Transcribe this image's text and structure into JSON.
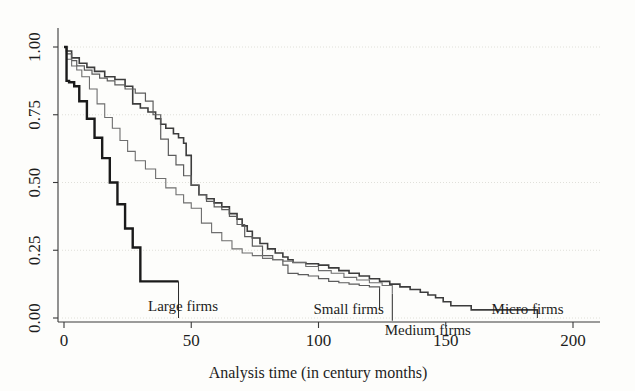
{
  "chart_data": {
    "type": "line",
    "subtype": "kaplan-meier-step",
    "title": "",
    "xlabel": "Analysis time (in century months)",
    "ylabel": "",
    "xlim": [
      -5,
      210
    ],
    "ylim": [
      0.0,
      1.0
    ],
    "xticks": [
      0,
      50,
      100,
      150,
      200
    ],
    "xtick_labels": [
      "0",
      "50",
      "100",
      "150",
      "200"
    ],
    "yticks": [
      0.0,
      0.25,
      0.5,
      0.75,
      1.0
    ],
    "ytick_labels": [
      "0.00",
      "0.25",
      "0.50",
      "0.75",
      "1.00"
    ],
    "grid": "horizontal-faint",
    "legend": "inline-annotations",
    "series": [
      {
        "name": "Micro firms",
        "label": "Micro firms",
        "color": "#3c3c3c",
        "stroke_width": 1.6,
        "x": [
          0,
          1,
          3,
          6,
          9,
          12,
          16,
          20,
          24,
          27,
          30,
          33,
          36,
          38,
          40,
          43,
          45,
          47,
          48,
          50,
          53,
          56,
          59,
          62,
          65,
          68,
          70,
          72,
          74,
          77,
          80,
          83,
          86,
          88,
          90,
          95,
          100,
          104,
          108,
          112,
          116,
          120,
          124,
          128,
          132,
          136,
          140,
          143,
          146,
          149,
          152,
          160,
          170,
          180,
          186
        ],
        "y": [
          1.0,
          0.985,
          0.96,
          0.94,
          0.925,
          0.91,
          0.89,
          0.88,
          0.855,
          0.79,
          0.775,
          0.76,
          0.735,
          0.715,
          0.7,
          0.68,
          0.665,
          0.645,
          0.6,
          0.49,
          0.455,
          0.44,
          0.425,
          0.41,
          0.385,
          0.365,
          0.34,
          0.32,
          0.295,
          0.275,
          0.255,
          0.24,
          0.225,
          0.215,
          0.205,
          0.2,
          0.195,
          0.185,
          0.175,
          0.165,
          0.155,
          0.145,
          0.135,
          0.125,
          0.115,
          0.105,
          0.095,
          0.085,
          0.075,
          0.06,
          0.045,
          0.03,
          0.03,
          0.03,
          0.015
        ]
      },
      {
        "name": "Small firms",
        "label": "Small firms",
        "color": "#5c5c5c",
        "stroke_width": 1.2,
        "x": [
          0,
          1,
          3,
          5,
          8,
          11,
          14,
          17,
          20,
          24,
          28,
          32,
          35,
          38,
          41,
          44,
          47,
          50,
          53,
          56,
          59,
          62,
          65,
          68,
          71,
          74,
          78,
          82,
          86,
          88,
          92,
          96,
          100,
          104,
          108,
          112,
          116,
          120,
          124
        ],
        "y": [
          1.0,
          0.975,
          0.95,
          0.93,
          0.915,
          0.9,
          0.885,
          0.875,
          0.86,
          0.845,
          0.83,
          0.8,
          0.75,
          0.66,
          0.6,
          0.565,
          0.525,
          0.49,
          0.455,
          0.43,
          0.41,
          0.4,
          0.375,
          0.345,
          0.3,
          0.265,
          0.23,
          0.215,
          0.195,
          0.165,
          0.16,
          0.155,
          0.145,
          0.135,
          0.13,
          0.125,
          0.12,
          0.115,
          0.11
        ]
      },
      {
        "name": "Medium firms",
        "label": "Medium firms",
        "color": "#6e6e6e",
        "stroke_width": 1.1,
        "x": [
          0,
          1,
          3,
          5,
          7,
          10,
          13,
          16,
          19,
          22,
          25,
          28,
          32,
          36,
          40,
          44,
          47,
          50,
          54,
          58,
          62,
          66,
          70,
          74,
          78,
          82,
          86,
          90,
          95,
          100,
          105,
          110,
          115,
          120,
          125,
          129
        ],
        "y": [
          1.0,
          0.955,
          0.93,
          0.915,
          0.89,
          0.845,
          0.79,
          0.74,
          0.7,
          0.655,
          0.615,
          0.58,
          0.55,
          0.515,
          0.48,
          0.455,
          0.425,
          0.405,
          0.35,
          0.315,
          0.285,
          0.255,
          0.24,
          0.23,
          0.22,
          0.215,
          0.21,
          0.205,
          0.19,
          0.175,
          0.165,
          0.15,
          0.14,
          0.13,
          0.12,
          0.09
        ]
      },
      {
        "name": "Large firms",
        "label": "Large firms",
        "color": "#1a1a1a",
        "stroke_width": 2.4,
        "x": [
          0,
          1,
          2,
          4,
          6,
          9,
          12,
          15,
          18,
          21,
          24,
          27,
          30,
          36,
          42,
          45
        ],
        "y": [
          1.0,
          0.875,
          0.87,
          0.855,
          0.8,
          0.735,
          0.665,
          0.59,
          0.5,
          0.42,
          0.33,
          0.26,
          0.135,
          0.135,
          0.135,
          0.135
        ]
      }
    ],
    "annotations": [
      {
        "name": "Large firms",
        "label_x": 33,
        "label_y": 0.045,
        "leader_x": 45,
        "leader_y_top": 0.135,
        "leader_y_bottom": 0.0
      },
      {
        "name": "Small firms",
        "label_x": 98,
        "label_y": 0.035,
        "leader_x": 124,
        "leader_y_top": 0.11,
        "leader_y_bottom": 0.03
      },
      {
        "name": "Medium firms",
        "label_x": 126,
        "label_y": -0.045,
        "leader_x": 129,
        "leader_y_top": 0.09,
        "leader_y_bottom": -0.01
      },
      {
        "name": "Micro firms",
        "label_x": 168,
        "label_y": 0.035,
        "leader_x": 186,
        "leader_y_top": 0.03,
        "leader_y_bottom": 0.0
      }
    ]
  },
  "axes": {
    "x_title": "Analysis time (in century months)",
    "x_tick_labels": [
      "0",
      "50",
      "100",
      "150",
      "200"
    ],
    "y_tick_labels": [
      "0.00",
      "0.25",
      "0.50",
      "0.75",
      "1.00"
    ]
  },
  "labels": {
    "large": "Large firms",
    "small": "Small firms",
    "medium": "Medium firms",
    "micro": "Micro firms"
  },
  "colors": {
    "background": "#fdfdfb",
    "axis": "#3a3a3a",
    "grid": "#d8d8d2",
    "micro": "#3c3c3c",
    "small": "#5c5c5c",
    "medium": "#6e6e6e",
    "large": "#1a1a1a"
  }
}
